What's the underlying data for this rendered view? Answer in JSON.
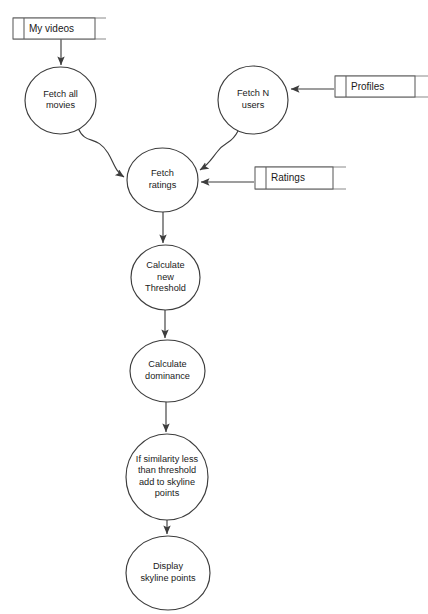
{
  "diagram": {
    "type": "data-flow-diagram",
    "canvas": {
      "width": 428,
      "height": 614
    },
    "colors": {
      "background": "#ffffff",
      "node_stroke": "#3d3d3d",
      "store_stroke": "#5c5c5c",
      "store_rule": "#8a8a8a",
      "text": "#1a1a1a"
    },
    "processes": [
      {
        "id": "fetch-all-movies",
        "lines": [
          "Fetch all",
          "movies"
        ],
        "cx": 60.5,
        "cy": 100.5,
        "rx": 35.5,
        "ry": 33.5
      },
      {
        "id": "fetch-n-users",
        "lines": [
          "Fetch N",
          "users"
        ],
        "cx": 253,
        "cy": 100,
        "rx": 35,
        "ry": 34
      },
      {
        "id": "fetch-ratings",
        "lines": [
          "Fetch",
          "ratings"
        ],
        "cx": 162.5,
        "cy": 180,
        "rx": 35.5,
        "ry": 32
      },
      {
        "id": "calculate-new-threshold",
        "lines": [
          "Calculate",
          "new",
          "Threshold"
        ],
        "cx": 165.5,
        "cy": 277.5,
        "rx": 34.5,
        "ry": 32.5
      },
      {
        "id": "calculate-dominance",
        "lines": [
          "Calculate",
          "dominance"
        ],
        "cx": 167.5,
        "cy": 371,
        "rx": 37.5,
        "ry": 31
      },
      {
        "id": "if-similarity-less-than-threshold",
        "lines": [
          "If similarity less",
          "than threshold",
          "add to skyline",
          "points"
        ],
        "cx": 167,
        "cy": 477,
        "rx": 41,
        "ry": 43
      },
      {
        "id": "display-skyline-points",
        "lines": [
          "Display",
          "skyline points"
        ],
        "cx": 168,
        "cy": 573,
        "rx": 42,
        "ry": 37
      }
    ],
    "data_stores": [
      {
        "id": "my-videos",
        "label": "My videos",
        "x": 13,
        "y": 18,
        "width": 82,
        "height": 21,
        "tab_width": 11,
        "rule_extend": 11
      },
      {
        "id": "profiles",
        "label": "Profiles",
        "x": 335,
        "y": 76,
        "width": 80,
        "height": 21,
        "tab_width": 11,
        "rule_extend": 13
      },
      {
        "id": "ratings",
        "label": "Ratings",
        "x": 255,
        "y": 167,
        "width": 78,
        "height": 22,
        "tab_width": 11,
        "rule_extend": 13
      }
    ],
    "flows": [
      {
        "id": "my-videos-to-fetch-all-movies",
        "from": "my-videos",
        "to": "fetch-all-movies",
        "path": "M 61 39 L 61 65",
        "arrow": "down"
      },
      {
        "id": "fetch-all-movies-to-fetch-ratings",
        "from": "fetch-all-movies",
        "to": "fetch-ratings",
        "path": "M 78 128 C 86 146 96 134 108 153 C 114 163 115 171 124 177",
        "arrow": "right"
      },
      {
        "id": "profiles-to-fetch-n-users",
        "from": "profiles",
        "to": "fetch-n-users",
        "path": "M 334 89 L 291 89",
        "arrow": "left"
      },
      {
        "id": "fetch-n-users-to-fetch-ratings",
        "from": "fetch-n-users",
        "to": "fetch-ratings",
        "path": "M 238 131 C 231 145 225 141 217 152 C 210 161 208 165 200 170",
        "arrow": "left-down"
      },
      {
        "id": "ratings-to-fetch-ratings",
        "from": "ratings",
        "to": "fetch-ratings",
        "path": "M 254 182 L 201 182",
        "arrow": "left"
      },
      {
        "id": "fetch-ratings-to-calculate-new-threshold",
        "from": "fetch-ratings",
        "to": "calculate-new-threshold",
        "path": "M 163 212 L 163 243",
        "arrow": "down"
      },
      {
        "id": "calculate-new-threshold-to-calculate-dominance",
        "from": "calculate-new-threshold",
        "to": "calculate-dominance",
        "path": "M 165 310 L 165 338",
        "arrow": "down"
      },
      {
        "id": "calculate-dominance-to-if-similarity",
        "from": "calculate-dominance",
        "to": "if-similarity-less-than-threshold",
        "path": "M 166 402 L 166 432",
        "arrow": "down"
      },
      {
        "id": "if-similarity-to-display-skyline-points",
        "from": "if-similarity-less-than-threshold",
        "to": "display-skyline-points",
        "path": "M 167 520 L 167 534",
        "arrow": "down"
      }
    ]
  }
}
